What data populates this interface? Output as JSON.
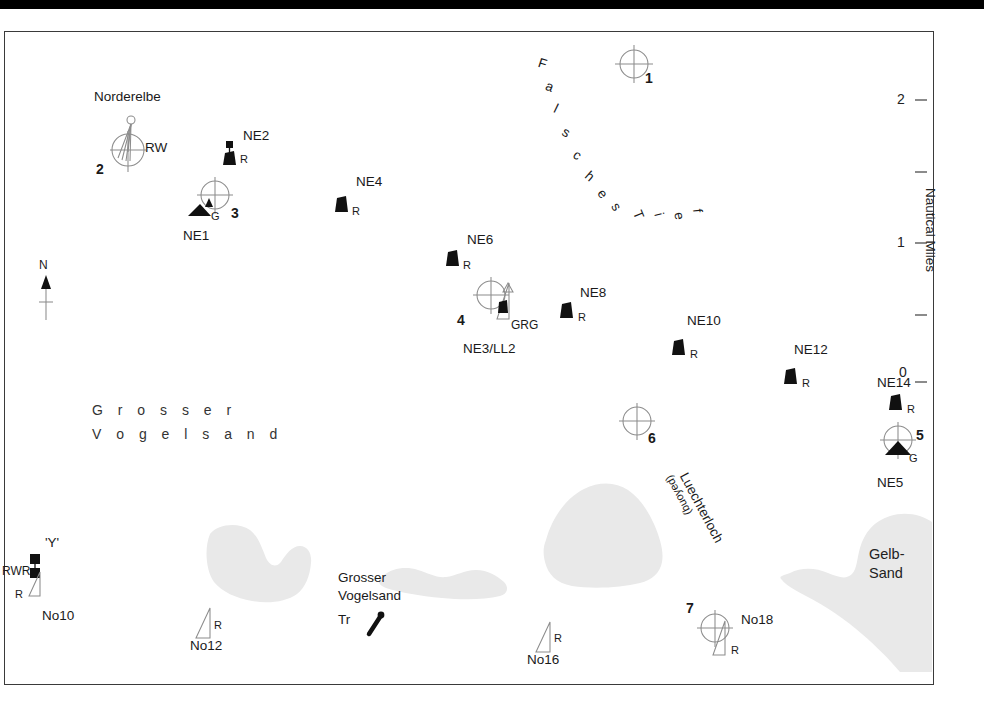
{
  "chart": {
    "title_area_labels": [
      {
        "text": "Grosser\nVogelsand",
        "kind": "sandbank-name"
      }
    ],
    "channel_labels": {
      "falsches_tief": "F a l s c h e s   T i e f",
      "falsches_tief_chars": [
        "F",
        "a",
        "l",
        "s",
        "c",
        "h",
        "e",
        "s",
        "T",
        "i",
        "e",
        "f"
      ],
      "luechterloch": "Luechterloch",
      "luechterloch_sub": "(buoyed)"
    },
    "area_names": {
      "grosser_vogelsand_line1": "G r o s s e r",
      "grosser_vogelsand_line2": "V o g e l s a n d",
      "gelb_sand_line1": "Gelb-",
      "gelb_sand_line2": "Sand"
    },
    "scale": {
      "unit_label": "Nautical Miles",
      "ticks": [
        {
          "label": "2",
          "value": 2,
          "major": true
        },
        {
          "label": "",
          "value": 1.5,
          "major": false
        },
        {
          "label": "1",
          "value": 1,
          "major": true
        },
        {
          "label": "",
          "value": 0.5,
          "major": false
        },
        {
          "label": "0",
          "value": 0,
          "major": true
        }
      ]
    },
    "north_arrow": {
      "label": "N"
    },
    "waypoints": [
      {
        "id": "wp1",
        "number": "1",
        "x": 634,
        "y": 64
      },
      {
        "id": "wp2",
        "number": "2",
        "x": 128,
        "y": 148,
        "name": "Norderelbe",
        "light": "RW",
        "symbol": "superbuoy"
      },
      {
        "id": "wp3",
        "number": "3",
        "x": 213,
        "y": 197,
        "name": "NE1",
        "light": "G",
        "symbol": "conical"
      },
      {
        "id": "wp4",
        "number": "4",
        "x": 491,
        "y": 297,
        "name": "NE3/LL2",
        "light": "GRG",
        "symbol": "spar-can"
      },
      {
        "id": "wp5",
        "number": "5",
        "x": 898,
        "y": 438,
        "name": "NE5",
        "light": "G",
        "symbol": "conical"
      },
      {
        "id": "wp6",
        "number": "6",
        "x": 637,
        "y": 423
      },
      {
        "id": "wp7",
        "number": "7",
        "x": 714,
        "y": 626,
        "name": "No18",
        "light": "R",
        "symbol": "spar"
      }
    ],
    "buoys": [
      {
        "name": "NE2",
        "light": "R",
        "x": 229,
        "y": 152,
        "symbol": "can-topmark"
      },
      {
        "name": "NE4",
        "light": "R",
        "x": 342,
        "y": 205,
        "symbol": "can"
      },
      {
        "name": "NE6",
        "light": "R",
        "x": 453,
        "y": 259,
        "symbol": "can"
      },
      {
        "name": "NE8",
        "light": "R",
        "x": 567,
        "y": 311,
        "symbol": "can"
      },
      {
        "name": "NE10",
        "light": "R",
        "x": 679,
        "y": 348,
        "symbol": "can"
      },
      {
        "name": "NE12",
        "light": "R",
        "x": 791,
        "y": 377,
        "symbol": "can"
      },
      {
        "name": "NE14",
        "light": "R",
        "x": 897,
        "y": 403,
        "symbol": "can"
      },
      {
        "name": "No10",
        "light": "R",
        "extra_light": "RWR",
        "topmark": "'Y'",
        "x": 38,
        "y": 570,
        "symbol": "pillar-double-square"
      },
      {
        "name": "No12",
        "light": "R",
        "x": 205,
        "y": 623,
        "symbol": "spar"
      },
      {
        "name": "No16",
        "light": "R",
        "x": 545,
        "y": 637,
        "symbol": "spar"
      }
    ],
    "landmarks": [
      {
        "name": "Grosser\nVogelsand",
        "type_label": "Tr",
        "x": 340,
        "y": 575
      }
    ]
  }
}
